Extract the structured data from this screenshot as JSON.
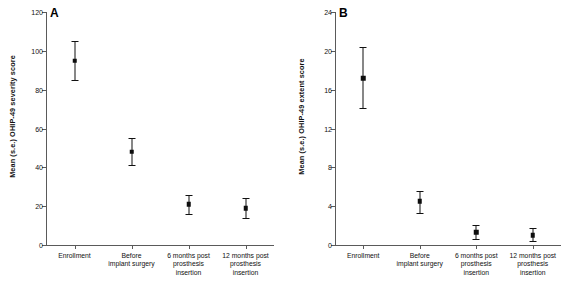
{
  "figure": {
    "background": "#ffffff",
    "marker_color": "#0d0d0d",
    "axis_color": "#5a5a5a"
  },
  "panels": [
    {
      "tag": "A",
      "ylabel": "Mean (s.e.) OHIP-49 severity score"
    },
    {
      "tag": "B",
      "ylabel": "Mean (s.e.) OHIP-49 extent score"
    }
  ],
  "chart_data": [
    {
      "type": "scatter",
      "panel": "A",
      "title": "A",
      "xlabel": "",
      "ylabel": "Mean (s.e.) OHIP-49 severity score",
      "categories": [
        "Enrollment",
        "Before implant surgery",
        "6 months post prosthesis insertion",
        "12 months post prosthesis insertion"
      ],
      "category_lines": [
        [
          "Enrollment"
        ],
        [
          "Before",
          "implant surgery"
        ],
        [
          "6 months post",
          "prosthesis",
          "insertion"
        ],
        [
          "12 months post",
          "prosthesis",
          "insertion"
        ]
      ],
      "values": [
        95,
        48,
        21,
        19
      ],
      "error_low": [
        85,
        41,
        16,
        14
      ],
      "error_high": [
        105,
        55,
        26,
        24
      ],
      "ylim": [
        0,
        120
      ],
      "yticks": [
        0,
        20,
        40,
        60,
        80,
        100,
        120
      ],
      "ytick_labels": [
        "0",
        "20",
        "40",
        "60",
        "80",
        "100",
        "120"
      ],
      "grid": false,
      "legend": "none"
    },
    {
      "type": "scatter",
      "panel": "B",
      "title": "B",
      "xlabel": "",
      "ylabel": "Mean (s.e.) OHIP-49 extent score",
      "categories": [
        "Enrollment",
        "Before implant surgery",
        "6 months post prosthesis insertion",
        "12 months post prosthesis insertion"
      ],
      "category_lines": [
        [
          "Enrollment"
        ],
        [
          "Before",
          "implant surgery"
        ],
        [
          "6 months post",
          "prosthesis",
          "insertion"
        ],
        [
          "12 months post",
          "prosthesis",
          "insertion"
        ]
      ],
      "values": [
        17.2,
        4.5,
        1.3,
        1.0
      ],
      "error_low": [
        14.1,
        3.3,
        0.6,
        0.4
      ],
      "error_high": [
        20.4,
        5.6,
        2.1,
        1.7
      ],
      "ylim": [
        0,
        24
      ],
      "yticks": [
        0,
        4,
        8,
        12,
        16,
        20,
        24
      ],
      "ytick_labels": [
        "0",
        "4",
        "8",
        "12",
        "16",
        "20",
        "24"
      ],
      "grid": false,
      "legend": "none"
    }
  ]
}
